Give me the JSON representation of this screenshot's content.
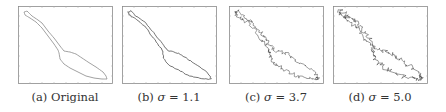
{
  "figure": {
    "panels": [
      {
        "id": "a",
        "label": "(a)",
        "caption_text": "Original",
        "sigma": null,
        "noise": 0
      },
      {
        "id": "b",
        "label": "(b)",
        "caption_symbol": "σ",
        "caption_eq": " = 1.1",
        "sigma": 1.1,
        "noise": 1.1
      },
      {
        "id": "c",
        "label": "(c)",
        "caption_symbol": "σ",
        "caption_eq": " = 3.7",
        "sigma": 3.7,
        "noise": 3.7
      },
      {
        "id": "d",
        "label": "(d)",
        "caption_symbol": "σ",
        "caption_eq": " = 5.0",
        "sigma": 5.0,
        "noise": 5.0
      }
    ],
    "colors": {
      "frame": "#8a8a8a",
      "trajectory_a": "#7a7a7a",
      "trajectory_noisy": "#3a3a3a"
    }
  }
}
